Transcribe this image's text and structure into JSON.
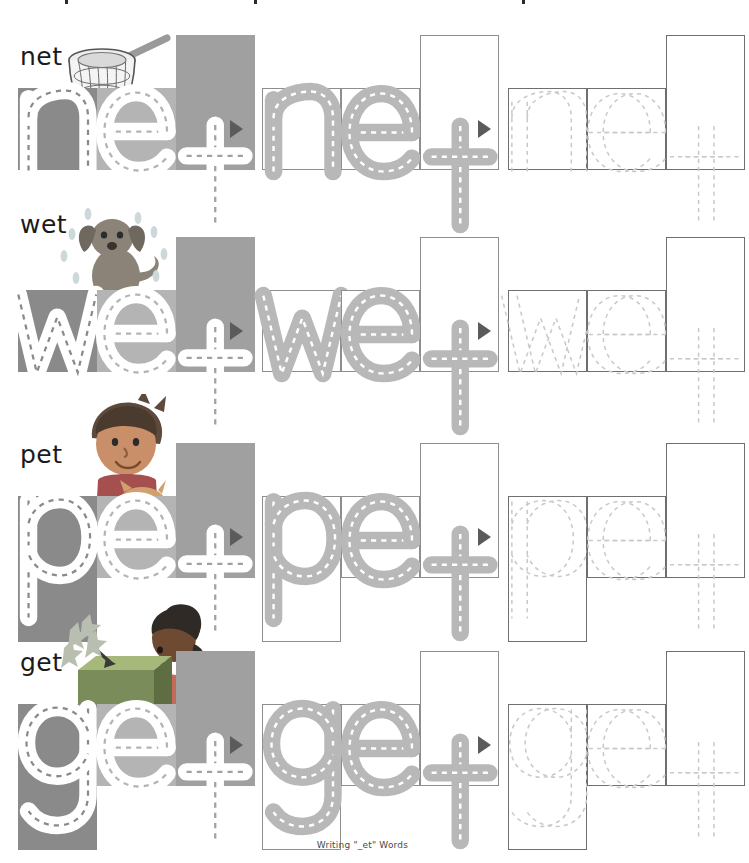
{
  "document": {
    "caption": "Writing \"_et\" Words",
    "page_width": 725,
    "page_height": 863
  },
  "colors": {
    "box_dark": "#8a8a8a",
    "box_light": "#b4b4b4",
    "box_medium": "#a0a0a0",
    "letter_white": "#ffffff",
    "letter_gray": "#b8b8b8",
    "trace_gray": "#c9c9c9",
    "outline_border": "#8e8e8e",
    "arrow": "#5b5b5b",
    "label_text": "#1a1a1a",
    "caption_text": "#4a4a4a"
  },
  "columns": [
    {
      "name": "traced-filled",
      "style": "filled"
    },
    {
      "name": "outlined-guide",
      "style": "outlined"
    },
    {
      "name": "blank-trace",
      "style": "traced"
    }
  ],
  "rows": [
    {
      "word": "net",
      "label": "net",
      "picture": "fishing-net-illustration",
      "letters": [
        {
          "char": "n",
          "tall": false,
          "descender": false,
          "box_color": "#8a8a8a"
        },
        {
          "char": "e",
          "tall": false,
          "descender": false,
          "box_color": "#b4b4b4"
        },
        {
          "char": "t",
          "tall": true,
          "descender": false,
          "box_color": "#a0a0a0"
        }
      ]
    },
    {
      "word": "wet",
      "label": "wet",
      "picture": "wet-dog-illustration",
      "letters": [
        {
          "char": "w",
          "tall": false,
          "descender": false,
          "box_color": "#8a8a8a"
        },
        {
          "char": "e",
          "tall": false,
          "descender": false,
          "box_color": "#b4b4b4"
        },
        {
          "char": "t",
          "tall": true,
          "descender": false,
          "box_color": "#a0a0a0"
        }
      ]
    },
    {
      "word": "pet",
      "label": "pet",
      "picture": "boy-with-cat-illustration",
      "letters": [
        {
          "char": "p",
          "tall": false,
          "descender": true,
          "box_color": "#8a8a8a"
        },
        {
          "char": "e",
          "tall": false,
          "descender": false,
          "box_color": "#b4b4b4"
        },
        {
          "char": "t",
          "tall": true,
          "descender": false,
          "box_color": "#a0a0a0"
        }
      ]
    },
    {
      "word": "get",
      "label": "get",
      "picture": "girl-opening-gift-illustration",
      "letters": [
        {
          "char": "g",
          "tall": false,
          "descender": true,
          "box_color": "#8a8a8a"
        },
        {
          "char": "e",
          "tall": false,
          "descender": false,
          "box_color": "#b4b4b4"
        },
        {
          "char": "t",
          "tall": true,
          "descender": false,
          "box_color": "#a0a0a0"
        }
      ]
    }
  ]
}
